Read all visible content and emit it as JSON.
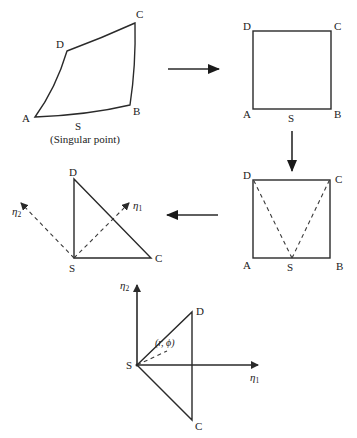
{
  "diagram": {
    "step1_curved_element": {
      "labels": {
        "A": "A",
        "B": "B",
        "C": "C",
        "D": "D",
        "S": "S"
      },
      "caption": "(Singular point)"
    },
    "step2_square": {
      "labels": {
        "A": "A",
        "B": "B",
        "C": "C",
        "D": "D",
        "S": "S"
      }
    },
    "step3_split_square": {
      "labels": {
        "A": "A",
        "B": "B",
        "C": "C",
        "D": "D",
        "S": "S"
      }
    },
    "step4_triangle": {
      "labels": {
        "D": "D",
        "S": "S",
        "C": "C"
      },
      "axis1": {
        "symbol": "η",
        "subscript": "1"
      },
      "axis2": {
        "symbol": "η",
        "subscript": "2"
      }
    },
    "step5_rotated_triangle": {
      "labels": {
        "D": "D",
        "S": "S",
        "C": "C"
      },
      "axis1": {
        "symbol": "η",
        "subscript": "1"
      },
      "axis2": {
        "symbol": "η",
        "subscript": "2"
      },
      "polar_label": "(r, ϕ)"
    },
    "colors": {
      "line": "#2a2a2a",
      "text": "#222222",
      "background": "#ffffff"
    }
  }
}
